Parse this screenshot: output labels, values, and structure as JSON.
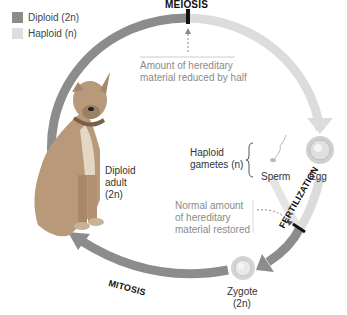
{
  "legend": {
    "items": [
      {
        "label": "Diploid (2n)",
        "color": "#8c8c8c"
      },
      {
        "label": "Haploid (n)",
        "color": "#d9d9d9"
      }
    ]
  },
  "stages": {
    "meiosis": "MEIOSIS",
    "fertilization": "FERTILIZATION",
    "mitosis": "MITOSIS"
  },
  "annotations": {
    "reduced_line1": "Amount of hereditary",
    "reduced_line2": "material reduced by half",
    "restored_line1": "Normal amount",
    "restored_line2": "of hereditary",
    "restored_line3": "material restored"
  },
  "organisms": {
    "adult_line1": "Diploid",
    "adult_line2": "adult",
    "adult_line3": "(2n)",
    "gametes_line1": "Haploid",
    "gametes_line2": "gametes (n)",
    "sperm": "Sperm",
    "egg": "Egg",
    "zygote_line1": "Zygote",
    "zygote_line2": "(2n)"
  },
  "colors": {
    "diploid": "#8c8c8c",
    "haploid": "#d9d9d9",
    "marker": "#111111"
  }
}
